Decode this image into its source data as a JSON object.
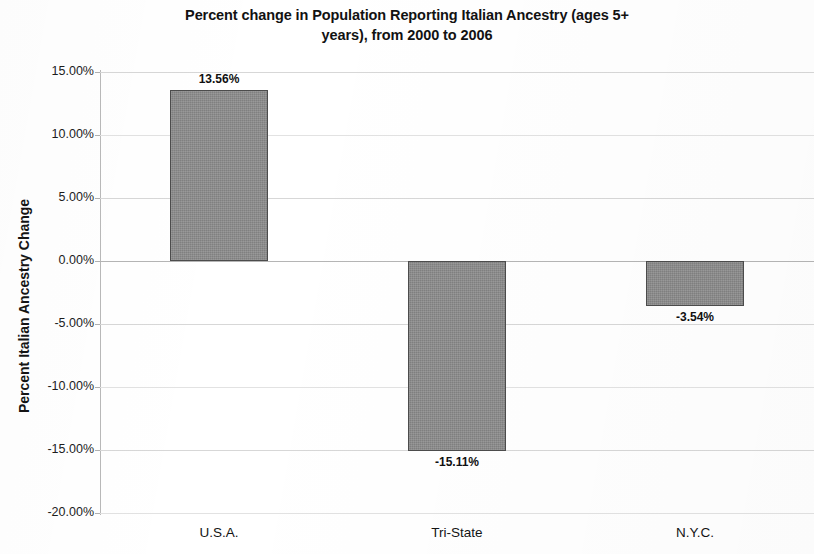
{
  "chart_data": {
    "type": "bar",
    "title": "Percent change in Population Reporting Italian Ancestry (ages 5+ years), from 2000 to 2006",
    "title_line1": "Percent change in Population Reporting Italian Ancestry (ages 5+",
    "title_line2": "years), from 2000 to 2006",
    "xlabel": "",
    "ylabel": "Percent Italian Ancestry Change",
    "categories": [
      "U.S.A.",
      "Tri-State",
      "N.Y.C."
    ],
    "values": [
      13.56,
      -15.11,
      -3.54
    ],
    "value_labels": [
      "13.56%",
      "-15.11%",
      "-3.54%"
    ],
    "ylim": [
      -20,
      15
    ],
    "ytick_values": [
      15,
      10,
      5,
      0,
      -5,
      -10,
      -15,
      -20
    ],
    "ytick_labels": [
      "15.00%",
      "10.00%",
      "5.00%",
      "0.00%",
      "-5.00%",
      "-10.00%",
      "-15.00%",
      "-20.00%"
    ],
    "grid": true,
    "legend": "none",
    "bar_color": "#8d8d8d",
    "bar_border_color": "#4c4c4c",
    "gridline_color": "#d7d7d7",
    "axis_color": "#b9b9b9"
  }
}
